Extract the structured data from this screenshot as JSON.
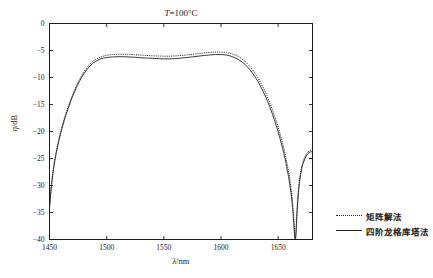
{
  "chart_data": {
    "type": "line",
    "title": "T=100°C",
    "title_parts": {
      "symbol": "T",
      "rest": "=100°C"
    },
    "xlabel": "λ/nm",
    "xlabel_parts": {
      "symbol": "λ",
      "sub": "",
      "rest": "/nm"
    },
    "ylabel": "η/dB",
    "ylabel_parts": {
      "symbol": "η",
      "rest": "/dB"
    },
    "xlim": [
      1450,
      1680
    ],
    "ylim": [
      -40,
      0
    ],
    "grid": false,
    "legend_position": "right-outside",
    "xticks": [
      1450,
      1500,
      1550,
      1600,
      1650
    ],
    "xtick_labels": [
      "1450",
      "1500",
      "1550",
      "1600",
      "1650"
    ],
    "yticks": [
      0,
      -5,
      -10,
      -15,
      -20,
      -25,
      -30,
      -35,
      -40
    ],
    "ytick_labels": [
      "0",
      "−5",
      "−10",
      "−15",
      "−20",
      "−25",
      "−30",
      "−35",
      "−40"
    ],
    "series": [
      {
        "name": "矩阵解法",
        "style": "dotted",
        "color": "#222222",
        "x": [
          1450,
          1452,
          1454,
          1456,
          1458,
          1460,
          1462,
          1464,
          1466,
          1468,
          1470,
          1473,
          1476,
          1480,
          1485,
          1490,
          1495,
          1500,
          1505,
          1510,
          1515,
          1520,
          1525,
          1530,
          1535,
          1540,
          1545,
          1550,
          1555,
          1560,
          1565,
          1570,
          1575,
          1580,
          1585,
          1590,
          1595,
          1600,
          1605,
          1610,
          1615,
          1620,
          1625,
          1630,
          1635,
          1640,
          1645,
          1650,
          1655,
          1658,
          1660,
          1662,
          1663,
          1664,
          1664.5,
          1665,
          1665.5,
          1666,
          1666.5,
          1667,
          1668,
          1669,
          1670,
          1671,
          1672,
          1674,
          1676,
          1678,
          1680
        ],
        "y": [
          -33.8,
          -29.2,
          -26.0,
          -23.6,
          -21.6,
          -19.9,
          -18.3,
          -16.9,
          -15.6,
          -14.4,
          -13.3,
          -11.8,
          -10.5,
          -9.0,
          -7.6,
          -6.7,
          -6.2,
          -5.9,
          -5.75,
          -5.7,
          -5.7,
          -5.72,
          -5.78,
          -5.85,
          -5.92,
          -5.98,
          -6.02,
          -6.05,
          -6.05,
          -6.0,
          -5.92,
          -5.82,
          -5.7,
          -5.58,
          -5.45,
          -5.35,
          -5.3,
          -5.3,
          -5.4,
          -5.65,
          -6.1,
          -6.85,
          -7.9,
          -9.3,
          -11.1,
          -13.3,
          -16.0,
          -19.2,
          -23.2,
          -26.2,
          -28.6,
          -31.9,
          -34.2,
          -37.3,
          -38.9,
          -40.0,
          -38.6,
          -36.4,
          -34.4,
          -32.8,
          -30.2,
          -28.4,
          -27.1,
          -26.1,
          -25.4,
          -24.4,
          -23.8,
          -23.5,
          -23.4
        ]
      },
      {
        "name": "四阶龙格库塔法",
        "style": "solid",
        "color": "#222222",
        "x": [
          1450,
          1452,
          1454,
          1456,
          1458,
          1460,
          1462,
          1464,
          1466,
          1468,
          1470,
          1473,
          1476,
          1480,
          1485,
          1490,
          1495,
          1500,
          1505,
          1510,
          1515,
          1520,
          1525,
          1530,
          1535,
          1540,
          1545,
          1550,
          1555,
          1560,
          1565,
          1570,
          1575,
          1580,
          1585,
          1590,
          1595,
          1600,
          1605,
          1610,
          1615,
          1620,
          1625,
          1630,
          1635,
          1640,
          1645,
          1650,
          1655,
          1658,
          1660,
          1662,
          1663,
          1664,
          1664.5,
          1665,
          1665.5,
          1666,
          1666.5,
          1667,
          1668,
          1669,
          1670,
          1671,
          1672,
          1674,
          1676,
          1678,
          1680
        ],
        "y": [
          -34.1,
          -29.5,
          -26.3,
          -23.9,
          -21.9,
          -20.2,
          -18.6,
          -17.2,
          -15.9,
          -14.7,
          -13.6,
          -12.1,
          -10.8,
          -9.35,
          -7.95,
          -7.05,
          -6.55,
          -6.3,
          -6.2,
          -6.15,
          -6.15,
          -6.2,
          -6.26,
          -6.34,
          -6.4,
          -6.46,
          -6.5,
          -6.55,
          -6.55,
          -6.5,
          -6.4,
          -6.3,
          -6.18,
          -6.05,
          -5.92,
          -5.82,
          -5.75,
          -5.75,
          -5.85,
          -6.15,
          -6.65,
          -7.4,
          -8.5,
          -9.95,
          -11.8,
          -14.05,
          -16.8,
          -20.1,
          -24.1,
          -27.2,
          -29.6,
          -32.9,
          -35.2,
          -38.3,
          -39.8,
          -40.0,
          -39.2,
          -37.0,
          -35.0,
          -33.4,
          -30.7,
          -28.9,
          -27.55,
          -26.5,
          -25.8,
          -24.75,
          -24.1,
          -23.8,
          -23.7
        ]
      }
    ]
  },
  "legend": {
    "entries": [
      {
        "label": "矩阵解法",
        "style": "dotted"
      },
      {
        "label": "四阶龙格库塔法",
        "style": "solid"
      }
    ]
  },
  "colors": {
    "axis": "#1a1a1a",
    "curve": "#222222",
    "background": "#ffffff"
  }
}
